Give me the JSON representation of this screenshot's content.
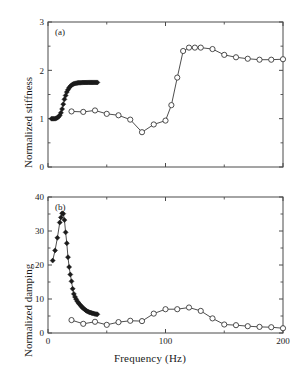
{
  "figure": {
    "x_axis_label": "Frequency  (Hz)",
    "panels": [
      {
        "tag": "(a)",
        "y_axis_label": "Normalized stiffness"
      },
      {
        "tag": "(b)",
        "y_axis_label": "Normalized damping"
      }
    ]
  },
  "chart_data": [
    {
      "type": "line",
      "panel": "(a)",
      "title": "",
      "xlabel": "Frequency  (Hz)",
      "ylabel": "Normalized stiffness",
      "xlim": [
        0,
        200
      ],
      "ylim": [
        0,
        3
      ],
      "xticks": [
        0,
        100,
        200
      ],
      "xtick_labels": [
        "",
        "",
        ""
      ],
      "xticks_minor": [
        50,
        150
      ],
      "yticks": [
        0,
        1,
        2,
        3
      ],
      "ytick_labels": [
        "0",
        "1",
        "2",
        "3"
      ],
      "yticks_minor": [
        0.5,
        1.5,
        2.5
      ],
      "grid": false,
      "legend": "none",
      "annotations": [
        "(a)"
      ],
      "series": [
        {
          "name": "filled-diamond-series",
          "marker": "filled-diamond",
          "x": [
            3,
            4,
            5,
            6,
            7,
            8,
            9,
            10,
            11,
            12,
            13,
            14,
            15,
            16,
            17,
            18,
            19,
            20,
            21,
            22,
            23,
            24,
            25,
            26,
            27,
            28,
            29,
            30,
            31,
            32,
            33,
            34,
            35,
            36,
            37,
            38,
            39,
            40,
            41,
            42
          ],
          "y": [
            1.0,
            1.0,
            1.0,
            1.0,
            1.01,
            1.02,
            1.04,
            1.07,
            1.12,
            1.2,
            1.3,
            1.4,
            1.48,
            1.55,
            1.6,
            1.64,
            1.67,
            1.69,
            1.71,
            1.72,
            1.73,
            1.735,
            1.74,
            1.742,
            1.744,
            1.745,
            1.746,
            1.747,
            1.748,
            1.748,
            1.749,
            1.749,
            1.75,
            1.75,
            1.75,
            1.75,
            1.75,
            1.75,
            1.75,
            1.75
          ]
        },
        {
          "name": "open-circle-series",
          "marker": "open-circle",
          "x": [
            20,
            30,
            40,
            50,
            60,
            70,
            80,
            90,
            100,
            105,
            110,
            115,
            120,
            125,
            130,
            140,
            150,
            160,
            170,
            180,
            190,
            200
          ],
          "y": [
            1.15,
            1.14,
            1.17,
            1.1,
            1.07,
            0.98,
            0.72,
            0.88,
            0.96,
            1.28,
            1.85,
            2.4,
            2.47,
            2.47,
            2.47,
            2.44,
            2.32,
            2.27,
            2.24,
            2.22,
            2.22,
            2.23
          ]
        }
      ]
    },
    {
      "type": "line",
      "panel": "(b)",
      "title": "",
      "xlabel": "Frequency  (Hz)",
      "ylabel": "Normalized damping",
      "xlim": [
        0,
        200
      ],
      "ylim": [
        0,
        40
      ],
      "xticks": [
        0,
        100,
        200
      ],
      "xtick_labels": [
        "0",
        "100",
        "200"
      ],
      "xticks_minor": [
        50,
        150
      ],
      "yticks": [
        0,
        10,
        20,
        30,
        40
      ],
      "ytick_labels": [
        "0",
        "10",
        "20",
        "30",
        "40"
      ],
      "yticks_minor": [
        5,
        15,
        25,
        35
      ],
      "grid": false,
      "legend": "none",
      "annotations": [
        "(b)"
      ],
      "series": [
        {
          "name": "filled-diamond-series",
          "marker": "filled-diamond",
          "x": [
            4,
            6,
            8,
            10,
            11,
            12,
            13,
            14,
            15,
            16,
            17,
            18,
            19,
            20,
            21,
            22,
            23,
            24,
            25,
            26,
            27,
            28,
            29,
            30,
            31,
            32,
            33,
            34,
            35,
            36,
            37,
            38,
            39,
            40,
            41,
            42
          ],
          "y": [
            21.3,
            24.3,
            28.0,
            32.5,
            34.0,
            35.2,
            35.1,
            33.2,
            29.6,
            26.4,
            22.3,
            19.4,
            17.2,
            15.2,
            13.0,
            11.5,
            10.6,
            9.9,
            9.3,
            8.8,
            8.4,
            8.0,
            7.6,
            7.3,
            7.0,
            6.7,
            6.5,
            6.3,
            6.1,
            6.0,
            5.9,
            5.8,
            5.7,
            5.6,
            5.55,
            5.5
          ]
        },
        {
          "name": "open-circle-series",
          "marker": "open-circle",
          "x": [
            20,
            30,
            40,
            50,
            60,
            70,
            80,
            90,
            100,
            110,
            120,
            130,
            140,
            150,
            160,
            170,
            180,
            190,
            200
          ],
          "y": [
            3.8,
            2.7,
            3.3,
            2.4,
            3.2,
            3.6,
            3.5,
            5.7,
            7.0,
            7.0,
            7.5,
            6.5,
            4.3,
            2.5,
            2.3,
            2.0,
            1.8,
            1.7,
            1.4
          ]
        }
      ]
    }
  ]
}
